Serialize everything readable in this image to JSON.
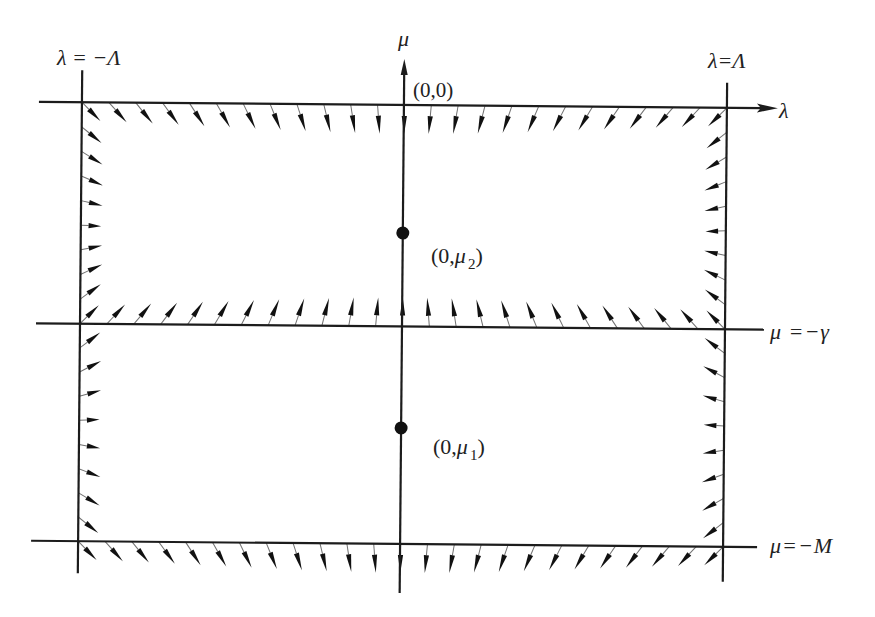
{
  "figure": {
    "labels": {
      "left_boundary": "λ = −Λ",
      "right_boundary": "λ=Λ",
      "mu_axis": "μ",
      "lambda_axis": "λ",
      "origin": "(0,0)",
      "gamma_line": "μ =−γ",
      "M_line": "μ=−M",
      "point_upper": {
        "open": "(0,",
        "var": "μ",
        "sub": "2",
        "close": ")"
      },
      "point_lower": {
        "open": "(0,",
        "var": "μ",
        "sub": "1",
        "close": ")"
      }
    },
    "geometry": {
      "rotation_deg": 0.5,
      "rotation_center": [
        403,
        325
      ],
      "lambda_left_x": 80,
      "lambda_right_x": 725,
      "mu_axis_x": 402,
      "mu_zero_y": 105,
      "mu_gamma_y": 326.5,
      "mu_M_y": 544,
      "lambda_axis_span": [
        37,
        776
      ],
      "gamma_line_span": [
        36,
        764
      ],
      "M_line_span": [
        33,
        759
      ],
      "left_line_span": [
        73,
        576
      ],
      "right_line_span": [
        80,
        579
      ],
      "mu_axis_span": [
        59,
        593
      ],
      "equilibria": [
        {
          "name": "mu2",
          "y": 233,
          "type": "sink"
        },
        {
          "name": "mu1",
          "y": 428,
          "type": "saddle"
        }
      ]
    },
    "vector_field": {
      "arrows_per_horizontal_edge": 25,
      "arrows_per_vertical_edge": 8,
      "regions": [
        {
          "name": "upper",
          "top": 105,
          "bottom": 326.5,
          "center_y": 233,
          "behavior": "sink"
        },
        {
          "name": "lower",
          "top": 326.5,
          "bottom": 544,
          "center_y": 428,
          "behavior": "saddle"
        }
      ],
      "horizontal_edges": [
        {
          "side": "mu=0",
          "y": 105,
          "region": "upper"
        },
        {
          "side": "mu=-gamma",
          "y": 326.5,
          "region": "upper"
        },
        {
          "side": "mu=-M",
          "y": 544,
          "region": "lower"
        }
      ],
      "vertical_edges": [
        {
          "side": "lambda=-Lambda",
          "x": 80,
          "region": "upper"
        },
        {
          "side": "lambda=Lambda",
          "x": 725,
          "region": "upper"
        },
        {
          "side": "lambda=-Lambda",
          "x": 80,
          "region": "lower"
        },
        {
          "side": "lambda=Lambda",
          "x": 725,
          "region": "lower"
        }
      ]
    },
    "colors": {
      "line": "#1c1c1c",
      "arrow_head": "#111111",
      "arrow_tail": "#707070",
      "point": "#111111",
      "text": "#222222"
    }
  }
}
